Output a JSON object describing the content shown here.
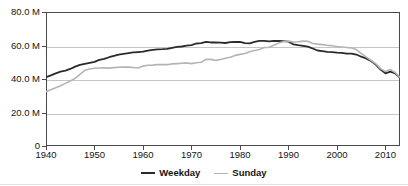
{
  "chart_data": {
    "type": "line",
    "title": "",
    "xlabel": "",
    "ylabel": "",
    "xlim": [
      1940,
      2013
    ],
    "ylim": [
      0,
      80
    ],
    "grid": true,
    "legend_position": "bottom-center",
    "y_ticks": [
      {
        "value": 80,
        "label": "80.0 M"
      },
      {
        "value": 60,
        "label": "60.0 M"
      },
      {
        "value": 40,
        "label": "40.0 M"
      },
      {
        "value": 20,
        "label": "20.0 M"
      },
      {
        "value": 0,
        "label": "0"
      }
    ],
    "x_ticks": [
      {
        "value": 1940,
        "label": "1940"
      },
      {
        "value": 1950,
        "label": "1950"
      },
      {
        "value": 1960,
        "label": "1960"
      },
      {
        "value": 1970,
        "label": "1970"
      },
      {
        "value": 1980,
        "label": "1980"
      },
      {
        "value": 1990,
        "label": "1990"
      },
      {
        "value": 2000,
        "label": "2000"
      },
      {
        "value": 2010,
        "label": "2010"
      }
    ],
    "units": "M",
    "series": [
      {
        "name": "Weekday",
        "color": "#2b2b2b",
        "width": 1.8,
        "x": [
          1940,
          1941,
          1942,
          1943,
          1944,
          1945,
          1946,
          1947,
          1948,
          1949,
          1950,
          1951,
          1952,
          1953,
          1954,
          1955,
          1956,
          1957,
          1958,
          1959,
          1960,
          1961,
          1962,
          1963,
          1964,
          1965,
          1966,
          1967,
          1968,
          1969,
          1970,
          1971,
          1972,
          1973,
          1974,
          1975,
          1976,
          1977,
          1978,
          1979,
          1980,
          1981,
          1982,
          1983,
          1984,
          1985,
          1986,
          1987,
          1988,
          1989,
          1990,
          1991,
          1992,
          1993,
          1994,
          1995,
          1996,
          1997,
          1998,
          1999,
          2000,
          2001,
          2002,
          2003,
          2004,
          2005,
          2006,
          2007,
          2008,
          2009,
          2010,
          2011,
          2012,
          2013
        ],
        "values": [
          41.1,
          42.2,
          43.4,
          44.4,
          45.0,
          46.0,
          47.4,
          48.4,
          49.0,
          49.6,
          50.2,
          51.4,
          52.0,
          53.0,
          53.8,
          54.5,
          55.0,
          55.5,
          55.9,
          56.1,
          56.3,
          57.0,
          57.4,
          57.7,
          57.8,
          58.0,
          58.6,
          59.2,
          59.4,
          59.9,
          60.2,
          61.2,
          61.4,
          62.2,
          61.8,
          61.8,
          61.7,
          61.5,
          62.0,
          62.1,
          62.2,
          61.4,
          61.3,
          62.2,
          62.8,
          62.8,
          62.5,
          62.8,
          62.7,
          62.6,
          62.3,
          60.7,
          60.2,
          59.8,
          59.3,
          58.2,
          57.0,
          56.7,
          56.2,
          56.1,
          55.8,
          55.6,
          55.2,
          55.2,
          54.6,
          53.3,
          52.3,
          50.7,
          48.6,
          45.6,
          43.4,
          44.4,
          43.4,
          40.7
        ]
      },
      {
        "name": "Sunday",
        "color": "#b4b4b4",
        "width": 1.6,
        "x": [
          1940,
          1941,
          1942,
          1943,
          1944,
          1945,
          1946,
          1947,
          1948,
          1949,
          1950,
          1951,
          1952,
          1953,
          1954,
          1955,
          1956,
          1957,
          1958,
          1959,
          1960,
          1961,
          1962,
          1963,
          1964,
          1965,
          1966,
          1967,
          1968,
          1969,
          1970,
          1971,
          1972,
          1973,
          1974,
          1975,
          1976,
          1977,
          1978,
          1979,
          1980,
          1981,
          1982,
          1983,
          1984,
          1985,
          1986,
          1987,
          1988,
          1989,
          1990,
          1991,
          1992,
          1993,
          1994,
          1995,
          1996,
          1997,
          1998,
          1999,
          2000,
          2001,
          2002,
          2003,
          2004,
          2005,
          2006,
          2007,
          2008,
          2009,
          2010,
          2011,
          2012,
          2013
        ],
        "values": [
          32.4,
          33.6,
          34.8,
          36.0,
          37.4,
          38.8,
          40.4,
          42.8,
          45.2,
          46.0,
          46.4,
          46.6,
          46.7,
          46.5,
          46.8,
          47.0,
          47.2,
          47.1,
          46.9,
          46.6,
          47.7,
          48.2,
          48.3,
          48.7,
          48.6,
          48.6,
          49.0,
          49.2,
          49.4,
          49.6,
          49.2,
          49.7,
          50.0,
          51.7,
          51.7,
          51.1,
          51.6,
          52.4,
          53.0,
          54.1,
          54.7,
          55.2,
          56.3,
          57.0,
          57.6,
          58.8,
          58.9,
          60.1,
          61.5,
          62.4,
          62.6,
          62.1,
          62.2,
          62.6,
          62.5,
          61.2,
          60.8,
          60.5,
          60.1,
          59.9,
          59.4,
          59.1,
          58.8,
          58.5,
          57.6,
          55.3,
          53.2,
          51.2,
          49.1,
          46.2,
          44.5,
          45.6,
          43.9,
          40.9
        ]
      }
    ]
  },
  "legend": {
    "items": [
      {
        "label": "Weekday",
        "color": "#2b2b2b"
      },
      {
        "label": "Sunday",
        "color": "#b4b4b4"
      }
    ]
  },
  "axes": {
    "frame_color": "#4a4a4a",
    "grid_color": "#c6c6c6"
  }
}
